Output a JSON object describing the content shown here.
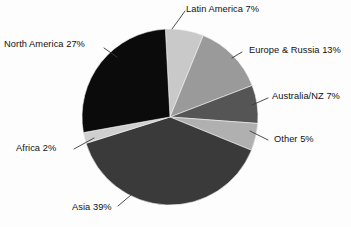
{
  "chart_data": {
    "type": "pie",
    "title": "",
    "subtitle": "",
    "xlabel": "",
    "ylabel": "",
    "legend_position": "none",
    "grid": false,
    "label_format": "{name} {value}%",
    "start_angle_deg": -3,
    "direction": "clockwise",
    "categories": [
      "Latin America",
      "Europe & Russia",
      "Australia/NZ",
      "Other",
      "Asia",
      "Africa",
      "North America"
    ],
    "values": [
      7,
      13,
      7,
      5,
      39,
      2,
      27
    ],
    "colors": [
      "#c9c9c9",
      "#9a9a9a",
      "#555555",
      "#b0b0b0",
      "#3a3a3a",
      "#cfcfcf",
      "#0b0b0b"
    ],
    "slices": [
      {
        "name": "Latin America",
        "value": 7,
        "label": "Latin America 7%",
        "color": "#c9c9c9"
      },
      {
        "name": "Europe & Russia",
        "value": 13,
        "label": "Europe & Russia 13%",
        "color": "#9a9a9a"
      },
      {
        "name": "Australia/NZ",
        "value": 7,
        "label": "Australia/NZ 7%",
        "color": "#555555"
      },
      {
        "name": "Other",
        "value": 5,
        "label": "Other 5%",
        "color": "#b0b0b0"
      },
      {
        "name": "Asia",
        "value": 39,
        "label": "Asia 39%",
        "color": "#3a3a3a"
      },
      {
        "name": "Africa",
        "value": 2,
        "label": "Africa 2%",
        "color": "#cfcfcf"
      },
      {
        "name": "North America",
        "value": 27,
        "label": "North America 27%",
        "color": "#0b0b0b"
      }
    ]
  },
  "labels": {
    "latin_america": "Latin America 7%",
    "europe_russia": "Europe & Russia 13%",
    "australia_nz": "Australia/NZ 7%",
    "other": "Other 5%",
    "north_america": "North America 27%",
    "africa": "Africa 2%",
    "asia": "Asia 39%"
  },
  "style": {
    "background": "#fdfdfd",
    "text_color": "#111111",
    "leader_color": "#3a3a3a"
  }
}
